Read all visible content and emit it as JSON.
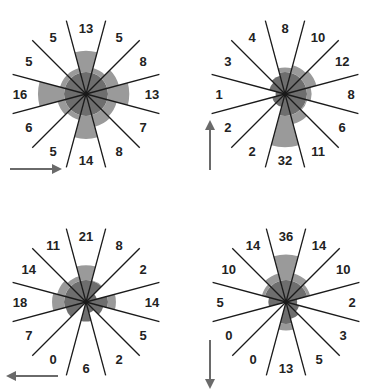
{
  "chart_data": [
    {
      "type": "rose",
      "panel": "top-left",
      "arrow_direction": "right",
      "sectors_clockwise_from_north": [
        "0°",
        "30°",
        "60°",
        "90°",
        "120°",
        "150°",
        "180°",
        "210°",
        "240°",
        "270°",
        "300°",
        "330°"
      ],
      "values": [
        13,
        5,
        8,
        13,
        7,
        8,
        14,
        5,
        6,
        16,
        5,
        5
      ],
      "center": [
        86,
        94
      ],
      "scale": 12
    },
    {
      "type": "rose",
      "panel": "top-right",
      "arrow_direction": "up",
      "sectors_clockwise_from_north": [
        "0°",
        "30°",
        "60°",
        "90°",
        "120°",
        "150°",
        "180°",
        "210°",
        "240°",
        "270°",
        "300°",
        "330°"
      ],
      "values": [
        8,
        10,
        12,
        8,
        6,
        11,
        32,
        2,
        2,
        1,
        3,
        4
      ],
      "center": [
        285,
        94
      ],
      "scale": 9.4
    },
    {
      "type": "rose",
      "panel": "bottom-left",
      "arrow_direction": "left",
      "sectors_clockwise_from_north": [
        "0°",
        "30°",
        "60°",
        "90°",
        "120°",
        "150°",
        "180°",
        "210°",
        "240°",
        "270°",
        "300°",
        "330°"
      ],
      "values": [
        21,
        8,
        2,
        14,
        5,
        2,
        6,
        0,
        7,
        18,
        14,
        11
      ],
      "center": [
        86,
        302
      ],
      "scale": 8
    },
    {
      "type": "rose",
      "panel": "bottom-right",
      "arrow_direction": "down",
      "sectors_clockwise_from_north": [
        "0°",
        "30°",
        "60°",
        "90°",
        "120°",
        "150°",
        "180°",
        "210°",
        "240°",
        "270°",
        "300°",
        "330°"
      ],
      "values": [
        36,
        14,
        10,
        2,
        3,
        5,
        13,
        0,
        0,
        5,
        10,
        14
      ],
      "center": [
        286,
        302
      ],
      "scale": 7.9
    }
  ],
  "style": {
    "line_color": "#1a1a1a",
    "wedge_dark": "#6e6e6e",
    "wedge_light": "#9a9a9a",
    "arrow_color": "#6a6a6a",
    "label_color": "#222222"
  },
  "arrows": [
    {
      "panel": "top-left",
      "x1": 10,
      "y1": 169,
      "x2": 60,
      "y2": 169
    },
    {
      "panel": "top-right",
      "x1": 210,
      "y1": 170,
      "x2": 210,
      "y2": 122
    },
    {
      "panel": "bottom-left",
      "x1": 58,
      "y1": 376,
      "x2": 8,
      "y2": 376
    },
    {
      "panel": "bottom-right",
      "x1": 210,
      "y1": 340,
      "x2": 210,
      "y2": 387
    }
  ]
}
